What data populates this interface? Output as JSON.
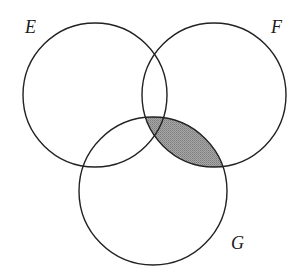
{
  "diagram": {
    "type": "venn",
    "sets": [
      {
        "name": "E",
        "label": "E",
        "cx": 95,
        "cy": 95,
        "r": 72,
        "label_x": 25,
        "label_y": 33
      },
      {
        "name": "F",
        "label": "F",
        "cx": 214,
        "cy": 95,
        "r": 72,
        "label_x": 271,
        "label_y": 33
      },
      {
        "name": "G",
        "label": "G",
        "cx": 153,
        "cy": 191,
        "r": 74,
        "label_x": 231,
        "label_y": 249
      }
    ],
    "shaded_region": {
      "description": "F ∩ G",
      "fill": "#9a9a9a"
    },
    "stroke_color": "#222222",
    "background": "#ffffff"
  }
}
